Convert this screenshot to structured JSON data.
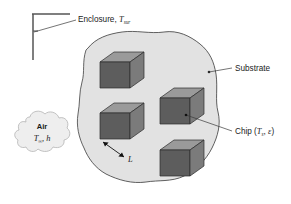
{
  "figure": {
    "background_color": "#ffffff"
  },
  "labels": {
    "enclosure": {
      "text": "Enclosure, ",
      "symbol": "T",
      "subscript": "sur",
      "name": "enclosure-label"
    },
    "substrate": {
      "text": "Substrate",
      "name": "substrate-label"
    },
    "chip": {
      "prefix": "Chip (",
      "symbol": "T",
      "subscript": "s",
      "separator": ", ",
      "emissivity": "ε",
      "suffix": ")",
      "name": "chip-label"
    },
    "air": {
      "title": "Air",
      "symbol": "T",
      "subscript": "∞",
      "separator": ", ",
      "coefficient": "h",
      "name": "air-label"
    },
    "length": {
      "text": "L",
      "name": "length-dimension-label"
    }
  },
  "colors": {
    "substrate_fill": "#e2e2e2",
    "substrate_rim": "#a8a8a8",
    "substrate_outline": "#4a4a4a",
    "chip_front": "#5d5d5d",
    "chip_top": "#9a9a9a",
    "chip_side": "#7b7b7b",
    "chip_outline": "#2b2b2b",
    "cloud_fill": "#eeeeee",
    "cloud_outline": "#b4b4b4",
    "enclosure_line": "#555555",
    "leader_line": "#3a3a3a",
    "text": "#1a1a1a"
  },
  "chips": [
    {
      "id": "chip-top-left",
      "x": 100,
      "y": 52
    },
    {
      "id": "chip-middle-left",
      "x": 100,
      "y": 103
    },
    {
      "id": "chip-middle-right",
      "x": 160,
      "y": 88
    },
    {
      "id": "chip-bottom-right",
      "x": 160,
      "y": 140
    }
  ]
}
